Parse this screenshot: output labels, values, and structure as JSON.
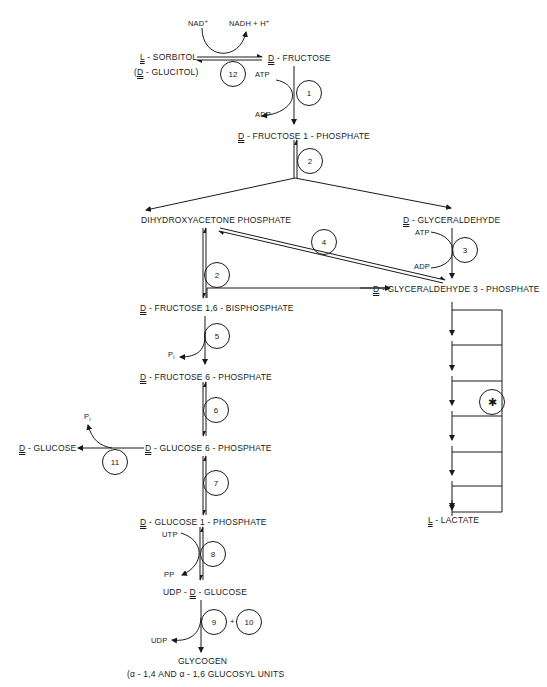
{
  "metabolites": {
    "sorbitol": {
      "prefix": "L",
      "name": " - SORBITOL"
    },
    "glucitol": {
      "prefix": "D",
      "name": " - GLUCITOL)",
      "open": "("
    },
    "fructose": {
      "prefix": "D",
      "name": " - FRUCTOSE"
    },
    "fructose_1_p": {
      "prefix": "D",
      "name": " - FRUCTOSE 1 - PHOSPHATE"
    },
    "dhap": {
      "name": "DIHYDROXYACETONE  PHOSPHATE"
    },
    "glyceraldehyde": {
      "prefix": "D",
      "name": " - GLYCERALDEHYDE"
    },
    "glyceraldehyde_3_p": {
      "prefix": "D",
      "name": " - GLYCERALDEHYDE 3 - PHOSPHATE"
    },
    "fructose_16_bp": {
      "prefix": "D",
      "name": " - FRUCTOSE 1,6 - BISPHOSPHATE"
    },
    "fructose_6_p": {
      "prefix": "D",
      "name": " - FRUCTOSE 6 - PHOSPHATE"
    },
    "glucose_6_p": {
      "prefix": "D",
      "name": " - GLUCOSE 6 - PHOSPHATE"
    },
    "glucose": {
      "prefix": "D",
      "name": " - GLUCOSE"
    },
    "glucose_1_p": {
      "prefix": "D",
      "name": " - GLUCOSE 1 - PHOSPHATE"
    },
    "udp_glucose": {
      "pre": "UDP - ",
      "prefix": "D",
      "name": " - GLUCOSE"
    },
    "glycogen": {
      "name": "GLYCOGEN"
    },
    "glycogen_sub": {
      "name": "(α - 1,4 AND α - 1,6 GLUCOSYL UNITS"
    },
    "lactate": {
      "prefix": "L",
      "name": " - LACTATE"
    }
  },
  "cofactors": {
    "nad": "NAD",
    "nad_sup": "+",
    "nadh": "NADH + H",
    "nadh_sup": "+",
    "atp1": "ATP",
    "adp1": "ADP",
    "atp3": "ATP",
    "adp3": "ADP",
    "pi5": "P",
    "pi5_sub": "i",
    "pi11": "P",
    "pi11_sub": "i",
    "utp": "UTP",
    "pp": "PP",
    "udp": "UDP"
  },
  "enzymes": {
    "e1": "1",
    "e2a": "2",
    "e2b": "2",
    "e3": "3",
    "e4": "4",
    "e5": "5",
    "e6": "6",
    "e7": "7",
    "e8": "8",
    "e9": "9",
    "e10": "10",
    "e11": "11",
    "e12": "12",
    "star": "✱",
    "plus": "+"
  }
}
